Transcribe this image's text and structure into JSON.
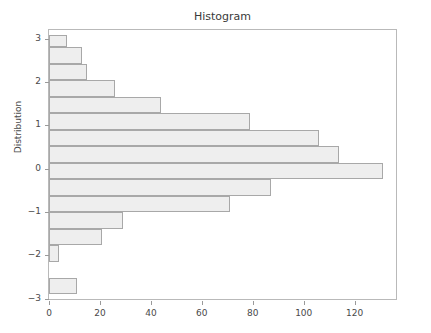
{
  "chart_data": {
    "type": "bar",
    "orientation": "horizontal",
    "title": "Histogram",
    "xlabel": "",
    "ylabel": "Distribution",
    "xlim": [
      0,
      137
    ],
    "ylim": [
      -3.05,
      3.2
    ],
    "grid": false,
    "legend": null,
    "xticks": [
      "0",
      "20",
      "40",
      "60",
      "80",
      "100",
      "120"
    ],
    "xtick_values": [
      0,
      20,
      40,
      60,
      80,
      100,
      120
    ],
    "yticks": [
      "3",
      "2",
      "1",
      "0",
      "-1",
      "-2",
      "-3"
    ],
    "ytick_values": [
      3,
      2,
      1,
      0,
      -1,
      -2,
      -3
    ],
    "bin_edges": [
      -2.9,
      -2.52,
      -2.14,
      -1.76,
      -1.38,
      -1.0,
      -0.62,
      -0.24,
      0.14,
      0.52,
      0.9,
      1.28,
      1.66,
      2.04,
      2.42,
      2.8,
      3.08
    ],
    "bins": [
      {
        "y_low": 2.8,
        "y_high": 3.08,
        "count": 7
      },
      {
        "y_low": 2.42,
        "y_high": 2.8,
        "count": 13
      },
      {
        "y_low": 2.04,
        "y_high": 2.42,
        "count": 15
      },
      {
        "y_low": 1.66,
        "y_high": 2.04,
        "count": 26
      },
      {
        "y_low": 1.28,
        "y_high": 1.66,
        "count": 44
      },
      {
        "y_low": 0.9,
        "y_high": 1.28,
        "count": 79
      },
      {
        "y_low": 0.52,
        "y_high": 0.9,
        "count": 106
      },
      {
        "y_low": 0.14,
        "y_high": 0.52,
        "count": 114
      },
      {
        "y_low": -0.24,
        "y_high": 0.14,
        "count": 131
      },
      {
        "y_low": -0.62,
        "y_high": -0.24,
        "count": 87
      },
      {
        "y_low": -1.0,
        "y_high": -0.62,
        "count": 71
      },
      {
        "y_low": -1.38,
        "y_high": -1.0,
        "count": 29
      },
      {
        "y_low": -1.76,
        "y_high": -1.38,
        "count": 21
      },
      {
        "y_low": -2.14,
        "y_high": -1.76,
        "count": 4
      },
      {
        "y_low": -2.52,
        "y_high": -2.14,
        "count": 0
      },
      {
        "y_low": -2.9,
        "y_high": -2.52,
        "count": 11
      }
    ],
    "values": [
      7,
      13,
      15,
      26,
      44,
      79,
      106,
      114,
      131,
      87,
      71,
      29,
      21,
      4,
      0,
      11
    ],
    "colors": {
      "bar_face": "#eeeeee",
      "bar_edge": "#a8a8a8",
      "axis": "#b9b9b9",
      "text": "#4a4a4a",
      "background": "#ffffff"
    }
  }
}
